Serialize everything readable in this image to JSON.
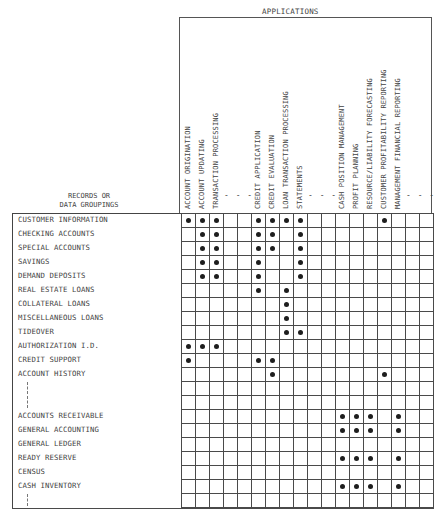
{
  "header": {
    "applications_title": "APPLICATIONS",
    "records_title_line1": "RECORDS OR",
    "records_title_line2": "DATA GROUPINGS"
  },
  "columns": [
    {
      "label": "ACCOUNT ORIGINATION"
    },
    {
      "label": "ACCOUNT UPDATING"
    },
    {
      "label": "TRANSACTION PROCESSING"
    },
    {
      "label": "",
      "placeholder": true
    },
    {
      "label": "",
      "placeholder": true
    },
    {
      "label": "CREDIT APPLICATION"
    },
    {
      "label": "CREDIT EVALUATION"
    },
    {
      "label": "LOAN TRANSACTION PROCESSING"
    },
    {
      "label": "STATEMENTS"
    },
    {
      "label": "",
      "placeholder": true
    },
    {
      "label": "",
      "placeholder": true
    },
    {
      "label": "CASH POSITION MANAGEMENT"
    },
    {
      "label": "PROFIT PLANNING"
    },
    {
      "label": "RESOURCE/LIABILITY FORECASTING"
    },
    {
      "label": "CUSTOMER PROFITABILITY REPORTING"
    },
    {
      "label": "MANAGEMENT FINANCIAL REPORTING"
    },
    {
      "label": "",
      "placeholder": true
    },
    {
      "label": "",
      "placeholder": true
    }
  ],
  "column_dash_groups": [
    "- - -",
    "- - -",
    "- - -"
  ],
  "rows": [
    {
      "label": "CUSTOMER INFORMATION",
      "marks": [
        1,
        2,
        3,
        6,
        7,
        8,
        9,
        15
      ]
    },
    {
      "label": "CHECKING ACCOUNTS",
      "marks": [
        2,
        3,
        6,
        7,
        9
      ]
    },
    {
      "label": "SPECIAL ACCOUNTS",
      "marks": [
        2,
        3,
        6,
        7,
        9
      ]
    },
    {
      "label": "SAVINGS",
      "marks": [
        2,
        3,
        6,
        9
      ]
    },
    {
      "label": "DEMAND DEPOSITS",
      "marks": [
        2,
        3,
        6,
        9
      ]
    },
    {
      "label": "REAL ESTATE LOANS",
      "marks": [
        6,
        8
      ]
    },
    {
      "label": "COLLATERAL LOANS",
      "marks": [
        8
      ]
    },
    {
      "label": "MISCELLANEOUS LOANS",
      "marks": [
        8
      ]
    },
    {
      "label": "TIDEOVER",
      "marks": [
        8,
        9
      ]
    },
    {
      "label": "AUTHORIZATION I.D.",
      "marks": [
        1,
        2,
        3
      ]
    },
    {
      "label": "CREDIT SUPPORT",
      "marks": [
        1,
        6,
        7
      ]
    },
    {
      "label": "ACCOUNT HISTORY",
      "marks": [
        7,
        15
      ]
    },
    {
      "label": "",
      "marks": [],
      "ellipsis": true
    },
    {
      "label": "",
      "marks": [],
      "ellipsis": true
    },
    {
      "label": "ACCOUNTS RECEIVABLE",
      "marks": [
        12,
        13,
        14,
        16
      ]
    },
    {
      "label": "GENERAL ACCOUNTING",
      "marks": [
        12,
        13,
        14,
        16
      ]
    },
    {
      "label": "GENERAL LEDGER",
      "marks": []
    },
    {
      "label": "READY RESERVE",
      "marks": [
        12,
        13,
        14,
        16
      ]
    },
    {
      "label": "CENSUS",
      "marks": []
    },
    {
      "label": "CASH INVENTORY",
      "marks": [
        12,
        13,
        14,
        16
      ]
    },
    {
      "label": "",
      "marks": [],
      "ellipsis": true
    }
  ],
  "colors": {
    "line": "#4a4a4a",
    "dot": "#1e1e1e",
    "text": "#3f3f3f"
  }
}
